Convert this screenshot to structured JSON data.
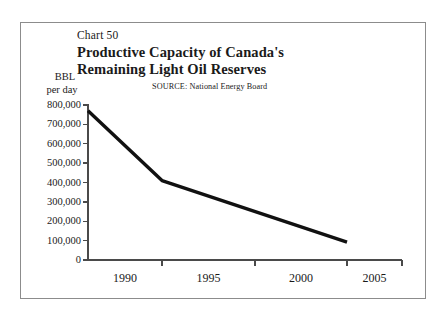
{
  "figure": {
    "chart_number": "Chart 50",
    "title_line_1": "Productive Capacity of Canada's",
    "title_line_2": "Remaining Light Oil Reserves",
    "source_note": "SOURCE:  National Energy Board",
    "axis_title_bbl": "BBL",
    "axis_title_per_day": "per day",
    "frame_color": "#8c8c8c",
    "line_color": "#111111",
    "axis_color": "#4a4a4a",
    "background": "#ffffff"
  },
  "chart_data": {
    "type": "line",
    "title": "Productive Capacity of Canada's Remaining Light Oil Reserves",
    "subtitle": "Chart 50",
    "annotation": "SOURCE:  National Energy Board",
    "xlabel": "",
    "ylabel": "BBL per day",
    "x": [
      1990,
      1995,
      2005
    ],
    "values": [
      770000,
      410000,
      92000
    ],
    "series": [
      {
        "name": "Productive capacity",
        "x": [
          1990,
          1995,
          2005
        ],
        "values": [
          770000,
          410000,
          92000
        ]
      }
    ],
    "xlim": [
      1990,
      2007
    ],
    "ylim": [
      0,
      800000
    ],
    "xticks": [
      1990,
      1995,
      2000,
      2005
    ],
    "xtick_labels": [
      "1990",
      "1995",
      "2000",
      "2005"
    ],
    "yticks": [
      0,
      100000,
      200000,
      300000,
      400000,
      500000,
      600000,
      700000,
      800000
    ],
    "ytick_labels": [
      "800,000",
      "700,000",
      "600,000",
      "500,000",
      "400,000",
      "300,000",
      "200,000",
      "100,000",
      "0"
    ],
    "grid": false,
    "legend": false,
    "legend_position": "none"
  }
}
